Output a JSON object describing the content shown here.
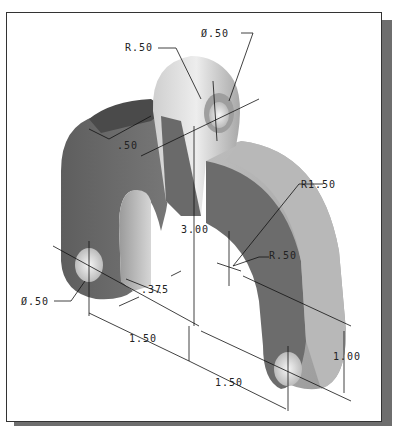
{
  "figure": {
    "type": "isometric engineering drawing",
    "colors": {
      "frame_border": "#333333",
      "shadow": "#6e6e6e",
      "part_dark": "#6a6a6a",
      "part_mid": "#8c8c8c",
      "part_light": "#c8c8c8",
      "dimension_line": "#111111"
    }
  },
  "dimensions": {
    "lug_radius": "R.50",
    "lug_hole_dia": "Ø.50",
    "thickness": ".50",
    "height": "3.00",
    "outer_radius": "R1.50",
    "inner_radius": "R.50",
    "foot_hole_dia": "Ø.50",
    "offset": ".375",
    "spacing_left": "1.50",
    "spacing_right": "1.50",
    "leg_depth": "1.00"
  }
}
